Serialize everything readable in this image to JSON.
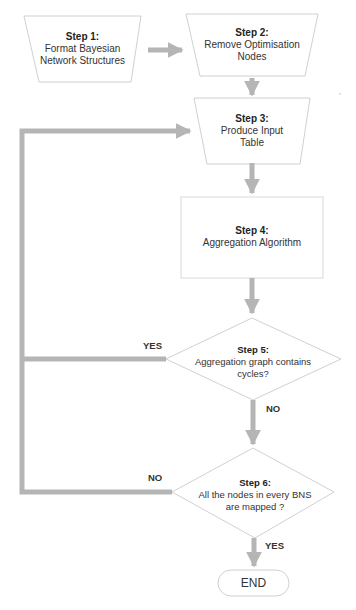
{
  "diagram": {
    "type": "flowchart",
    "colors": {
      "arrow": "#b5b5b5",
      "shape_stroke": "#bdbdbd",
      "shape_fill": "#ffffff",
      "text": "#333333"
    },
    "nodes": [
      {
        "id": "step1",
        "shape": "trapezoid",
        "title": "Step 1:",
        "lines": [
          "Format Bayesian",
          "Network Structures"
        ]
      },
      {
        "id": "step2",
        "shape": "trapezoid",
        "title": "Step 2:",
        "lines": [
          "Remove Optimisation",
          "Nodes"
        ]
      },
      {
        "id": "step3",
        "shape": "trapezoid",
        "title": "Step 3:",
        "lines": [
          "Produce Input",
          "Table"
        ]
      },
      {
        "id": "step4",
        "shape": "rectangle",
        "title": "Step 4:",
        "lines": [
          "Aggregation Algorithm"
        ]
      },
      {
        "id": "step5",
        "shape": "diamond",
        "title": "Step 5:",
        "lines": [
          "Aggregation graph contains",
          "cycles?"
        ]
      },
      {
        "id": "step6",
        "shape": "diamond",
        "title": "Step 6:",
        "lines": [
          "All the nodes in every BNS",
          "are mapped ?"
        ]
      },
      {
        "id": "end",
        "shape": "terminator",
        "label": "END"
      }
    ],
    "edges": [
      {
        "from": "step1",
        "to": "step2",
        "label": ""
      },
      {
        "from": "step2",
        "to": "step3",
        "label": ""
      },
      {
        "from": "step3",
        "to": "step4",
        "label": ""
      },
      {
        "from": "step4",
        "to": "step5",
        "label": ""
      },
      {
        "from": "step5",
        "to": "step3",
        "label": "YES"
      },
      {
        "from": "step5",
        "to": "step6",
        "label": "NO"
      },
      {
        "from": "step6",
        "to": "step3",
        "label": "NO"
      },
      {
        "from": "step6",
        "to": "end",
        "label": "YES"
      }
    ],
    "branch_labels": {
      "step5_yes": "YES",
      "step5_no": "NO",
      "step6_no": "NO",
      "step6_yes": "YES"
    }
  }
}
